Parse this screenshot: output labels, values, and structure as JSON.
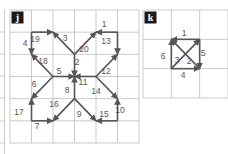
{
  "panels": [
    {
      "id": "j",
      "label": "j",
      "grid": {
        "cols": 6,
        "rows": 6,
        "x0": 10,
        "y0": 10,
        "x1": 139,
        "y1": 143
      },
      "arrows": [
        {
          "n": "1",
          "from": [
            5,
            1
          ],
          "to": [
            4,
            1
          ],
          "lx": 104,
          "ly": 27
        },
        {
          "n": "2",
          "from": [
            3,
            2
          ],
          "to": [
            3,
            3
          ],
          "lx": 77,
          "ly": 65
        },
        {
          "n": "3",
          "from": [
            3,
            2
          ],
          "to": [
            2,
            1
          ],
          "lx": 65,
          "ly": 41
        },
        {
          "n": "4",
          "from": [
            1,
            1
          ],
          "to": [
            1,
            2
          ],
          "lx": 25,
          "ly": 46
        },
        {
          "n": "5",
          "from": [
            2,
            3
          ],
          "to": [
            3,
            3
          ],
          "lx": 59,
          "ly": 74
        },
        {
          "n": "6",
          "from": [
            2,
            3
          ],
          "to": [
            1,
            4
          ],
          "lx": 34,
          "ly": 87
        },
        {
          "n": "7",
          "from": [
            1,
            5
          ],
          "to": [
            2,
            5
          ],
          "lx": 37,
          "ly": 129
        },
        {
          "n": "8",
          "from": [
            3,
            4
          ],
          "to": [
            3,
            3
          ],
          "lx": 67,
          "ly": 93
        },
        {
          "n": "9",
          "from": [
            3,
            4
          ],
          "to": [
            4,
            5
          ],
          "lx": 79,
          "ly": 117
        },
        {
          "n": "10",
          "from": [
            5,
            5
          ],
          "to": [
            5,
            4
          ],
          "lx": 120,
          "ly": 113
        },
        {
          "n": "11",
          "from": [
            4,
            3
          ],
          "to": [
            3,
            3
          ],
          "lx": 83,
          "ly": 85
        },
        {
          "n": "12",
          "from": [
            4,
            3
          ],
          "to": [
            5,
            2
          ],
          "lx": 106,
          "ly": 74
        },
        {
          "n": "13",
          "from": [
            5,
            1
          ],
          "to": [
            5,
            2
          ],
          "lx": 106,
          "ly": 44
        },
        {
          "n": "14",
          "from": [
            4,
            3
          ],
          "to": [
            5,
            4
          ],
          "lx": 96,
          "ly": 94
        },
        {
          "n": "15",
          "from": [
            5,
            5
          ],
          "to": [
            4,
            5
          ],
          "lx": 104,
          "ly": 117
        },
        {
          "n": "16",
          "from": [
            3,
            4
          ],
          "to": [
            2,
            5
          ],
          "lx": 54,
          "ly": 107
        },
        {
          "n": "17",
          "from": [
            1,
            5
          ],
          "to": [
            1,
            4
          ],
          "lx": 19,
          "ly": 115
        },
        {
          "n": "18",
          "from": [
            2,
            3
          ],
          "to": [
            1,
            2
          ],
          "lx": 43,
          "ly": 64
        },
        {
          "n": "19",
          "from": [
            1,
            1
          ],
          "to": [
            2,
            1
          ],
          "lx": 35,
          "ly": 42
        },
        {
          "n": "20",
          "from": [
            3,
            2
          ],
          "to": [
            4,
            1
          ],
          "lx": 84,
          "ly": 52
        }
      ]
    },
    {
      "id": "k",
      "label": "k",
      "grid": {
        "cols": 3,
        "rows": 3,
        "x0": 143,
        "y0": 10,
        "x1": 228,
        "y1": 98
      },
      "arrows": [
        {
          "n": "1",
          "from": [
            2,
            1
          ],
          "to": [
            1,
            1
          ],
          "lx": 184,
          "ly": 36
        },
        {
          "n": "2",
          "from": [
            2,
            2
          ],
          "to": [
            1,
            1
          ],
          "lx": 189,
          "ly": 64
        },
        {
          "n": "3",
          "from": [
            1,
            2
          ],
          "to": [
            2,
            1
          ],
          "lx": 177,
          "ly": 63
        },
        {
          "n": "4",
          "from": [
            1,
            2
          ],
          "to": [
            2,
            2
          ],
          "lx": 183,
          "ly": 78
        },
        {
          "n": "5",
          "from": [
            2,
            1
          ],
          "to": [
            2,
            2
          ],
          "lx": 203,
          "ly": 56
        },
        {
          "n": "6",
          "from": [
            1,
            2
          ],
          "to": [
            1,
            1
          ],
          "lx": 163,
          "ly": 59
        }
      ]
    }
  ],
  "colors": {
    "arrow": "#555555",
    "grid": "#bdbdbd",
    "badge": "#1a1a1a",
    "label": "#555555"
  }
}
